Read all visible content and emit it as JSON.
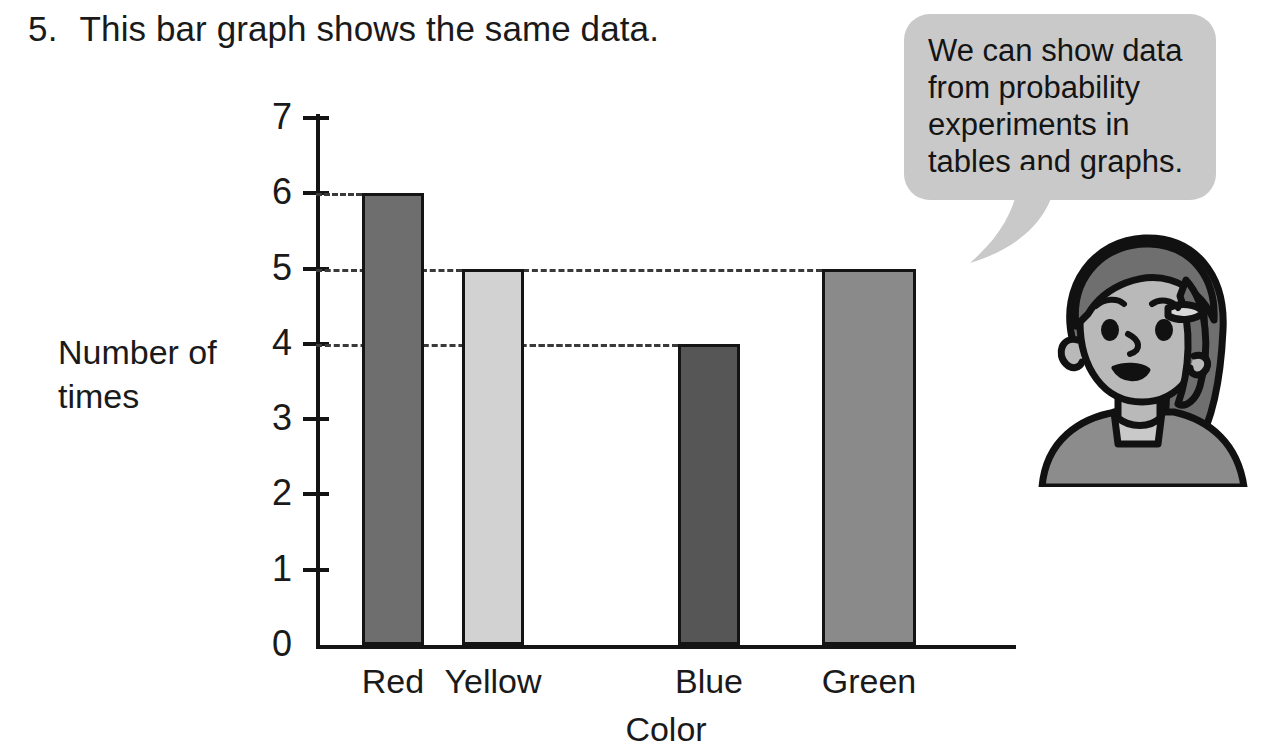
{
  "question": {
    "number": "5.",
    "text": "This bar graph shows the same data."
  },
  "speech_bubble": {
    "text": "We can show data from probability experiments in tables and graphs.",
    "background_color": "#c9c9c9"
  },
  "character": {
    "name": "girl-illustration",
    "hair_color": "#6f6f6f",
    "skin_color": "#b9b9b9",
    "shirt_color": "#8c8c8c"
  },
  "chart_data": {
    "type": "bar",
    "title": "This bar graph shows the same data.",
    "categories": [
      "Red",
      "Yellow",
      "Blue",
      "Green"
    ],
    "values": [
      6,
      5,
      4,
      5
    ],
    "xlabel": "Color",
    "ylabel": "Number of times",
    "ylabel_lines": [
      "Number of",
      "times"
    ],
    "ylim": [
      0,
      7
    ],
    "yticks": [
      0,
      1,
      2,
      3,
      4,
      5,
      6,
      7
    ],
    "ytick_labels": [
      "0",
      "1",
      "2",
      "3",
      "4",
      "5",
      "6",
      "7"
    ],
    "grid": true,
    "gridlines_at": [
      6,
      5,
      4
    ],
    "gridline_style": "dashed",
    "legend": "none",
    "bar_colors": [
      "#6e6e6e",
      "#d2d2d2",
      "#565656",
      "#8a8a8a"
    ],
    "bar_border_color": "#141414"
  }
}
